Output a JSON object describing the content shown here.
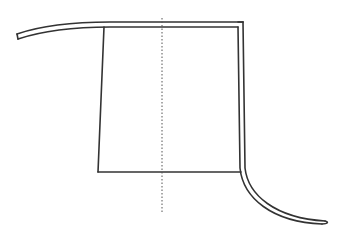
{
  "diagram": {
    "title": "",
    "width": 343,
    "height": 238,
    "background": "#ffffff",
    "stroke_color": "#333333",
    "dotted_color": "#555555",
    "stroke_width": 1.6,
    "shapes": [
      {
        "id": "top-band-outer",
        "type": "path",
        "d": "M17 34 C 40 26, 70 22, 110 22 L 243 22"
      },
      {
        "id": "top-band-inner",
        "type": "path",
        "d": "M18 39 C 42 31, 72 27, 110 27 L 238 27"
      },
      {
        "id": "top-band-endcap",
        "type": "path",
        "d": "M17 34 L 18 39"
      },
      {
        "id": "top-right-corner-cap",
        "type": "path",
        "d": "M238 22 L 243 22"
      },
      {
        "id": "right-band-outer",
        "type": "path",
        "d": "M243 22 L 245 168 C 248 195, 275 218, 325 221"
      },
      {
        "id": "right-band-inner",
        "type": "path",
        "d": "M238 27 L 240 168 C 243 198, 272 222, 322 224"
      },
      {
        "id": "right-band-endcap",
        "type": "path",
        "d": "M325 221 C 329 222, 328 224, 322 224"
      },
      {
        "id": "panel-left-edge",
        "type": "path",
        "d": "M104 27 L 98 172"
      },
      {
        "id": "panel-bottom-edge",
        "type": "path",
        "d": "M98 172 L 241 172"
      }
    ],
    "center_line": {
      "x": 162,
      "y1": 18,
      "y2": 213,
      "dash": "1.5 2"
    }
  }
}
